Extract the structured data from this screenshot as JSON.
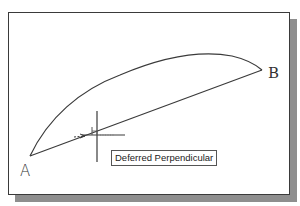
{
  "drawing": {
    "points": {
      "a": {
        "label": "A",
        "x": 30,
        "y": 156
      },
      "b": {
        "label": "B",
        "x": 262,
        "y": 70
      }
    },
    "objects": [
      {
        "type": "line",
        "from": "A",
        "to": "B"
      },
      {
        "type": "arc",
        "from": "A",
        "to": "B"
      }
    ]
  },
  "cursor": {
    "x": 97,
    "y": 135,
    "snap_marker": "deferred-perpendicular-marker"
  },
  "tooltip": {
    "text": "Deferred Perpendicular"
  },
  "colors": {
    "line": "#3a3a3a",
    "frame": "#3a3a3a",
    "shadow": "#8e8e8e",
    "background": "#ffffff"
  }
}
